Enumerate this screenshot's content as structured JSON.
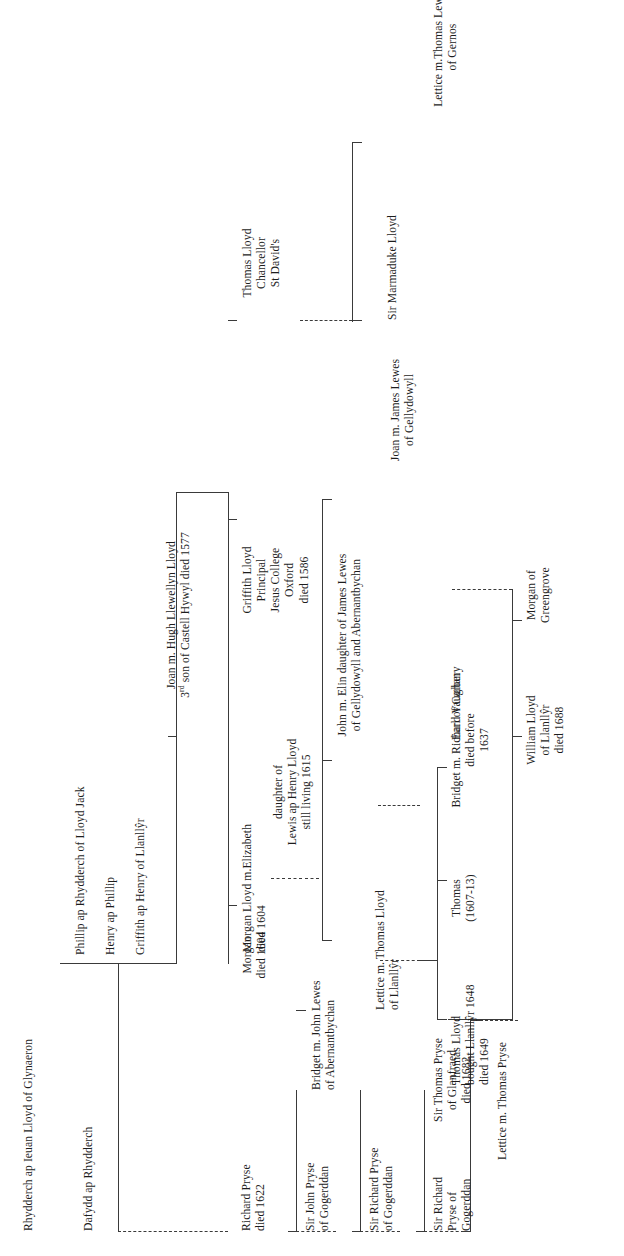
{
  "orientation": "text rotated 90 degrees counter-clockwise, reads bottom-to-top",
  "colors": {
    "ink": "#1d1d1d",
    "rule": "#3a3a3a",
    "background": "#ffffff"
  },
  "nodes": {
    "rhydderch": {
      "l1": "Rhydderch ap Ieuan Lloyd of Glynaeron"
    },
    "dafydd": {
      "l1": "Dafydd ap Rhydderch"
    },
    "phillip": {
      "l1": "Phillip ap Rhydderch of Lloyd Jack"
    },
    "henry": {
      "l1": "Henry ap Phillip"
    },
    "griffith_llanllyr": {
      "l1": "Griffith ap Henry of Llanllŷr"
    },
    "joan_hugh": {
      "l1": "Joan m. Hugh Llewellyn Lloyd",
      "l2_pre": "3",
      "l2_sup": "rd",
      "l2_post": " son of Castell Hywyl died 1577"
    },
    "griffith_lloyd": {
      "l1": "Griffith Lloyd",
      "l2": "Principal",
      "l3": "Jesus College",
      "l4": "Oxford",
      "l5": "died 1586"
    },
    "thomas_lloyd_chancellor": {
      "l1": "Thomas Lloyd",
      "l2": "Chancellor",
      "l3": "St David's"
    },
    "marmaduke": {
      "l1": "Sir Marmaduke Lloyd"
    },
    "lettice_gernos": {
      "l1": "Lettice m.Thomas Lewes",
      "l2": "of Gernos"
    },
    "morgan_lloyd": {
      "l1": "Morgan Lloyd m.Elizabeth",
      "l2": "died 1604"
    },
    "elizabeth": {
      "l1": "daughter of",
      "l2": "Lewis ap Henry Lloyd",
      "l3": "still living 1615"
    },
    "john_elin": {
      "l1": "John m. Elin daughter of James Lewes",
      "l2": "of Gellydowyll and Abernantbychan"
    },
    "joan_james_lewes": {
      "l1": "Joan m. James Lewes",
      "l2": "of Gellydowyll"
    },
    "morgan_died_1604": {
      "l1": "Morgan",
      "l2": "died 1604"
    },
    "bridget_john_lewes": {
      "l1": "Bridget m. John Lewes",
      "l2": "of Abernantbychan"
    },
    "lettice_thomas_lloyd": {
      "l1": "Lettice  m. Thomas Lloyd",
      "l2": "of Llanllŷr"
    },
    "thomas_1607_13": {
      "l1": "Thomas",
      "l2": "(1607-13)"
    },
    "bridget_vaughan": {
      "l1": "Bridget m. Richard Vaughan",
      "l2": "died before",
      "l3": "1637"
    },
    "earl_carbery": {
      "l1": "Earl of Carbery"
    },
    "thomas_lloyd_bought": {
      "l1": "Thomas Lloyd",
      "l2": "bought Llanllŷr 1648",
      "l3": "died 1649"
    },
    "william_lloyd": {
      "l1": "William Lloyd",
      "l2": "of Llanllŷr",
      "l3": "died 1688"
    },
    "morgan_greengrove": {
      "l1": "Morgan of",
      "l2": "Greengrove"
    },
    "richard_pryse": {
      "l1": "Richard Pryse",
      "l2": "died 1622"
    },
    "john_pryse": {
      "l1": "Sir John Pryse",
      "l2": "of Gogerddan"
    },
    "richard_pryse_gog": {
      "l1": "Sir Richard Pryse",
      "l2": "of Gogerddan"
    },
    "richard_pryse_of_gog": {
      "l1": "Sir Richard",
      "l2": "Pryse of",
      "l3": "Gogerddan"
    },
    "thomas_pryse": {
      "l1": "Sir Thomas Pryse",
      "l2": "of Glanfraed",
      "l3": "died 1682"
    },
    "lettice_thomas_pryse": {
      "l1": "Lettice m. Thomas Pryse"
    }
  }
}
